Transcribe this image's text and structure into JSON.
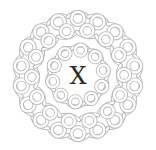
{
  "image": {
    "description": "Circular Celtic knot emblem with a letter in the center",
    "center_letter": "X",
    "knot_icon": "celtic-knot-circle",
    "colors": {
      "background": "#ffffff",
      "knot_stroke": "#b9b9b9",
      "letter": "#2a2a2a"
    }
  }
}
